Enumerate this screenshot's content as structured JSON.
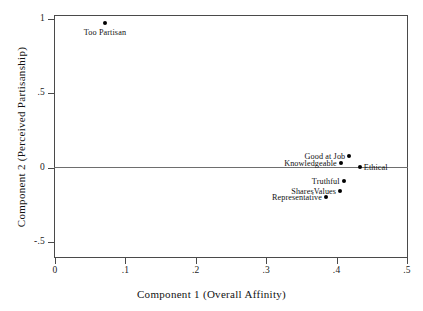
{
  "chart_data": {
    "type": "scatter",
    "title": "",
    "xlabel": "Component 1 (Overall Affinity)",
    "ylabel": "Component 2 (Perceived Partisanship)",
    "xlim": [
      0,
      0.5
    ],
    "ylim": [
      -0.5,
      1
    ],
    "xticks": [
      "0",
      ".1",
      ".2",
      ".3",
      ".4",
      ".5"
    ],
    "xtick_values": [
      0,
      0.1,
      0.2,
      0.3,
      0.4,
      0.5
    ],
    "yticks": [
      "1",
      ".5",
      "0",
      "-.5"
    ],
    "ytick_values": [
      1,
      0.5,
      0,
      -0.5
    ],
    "grid": false,
    "legend": "none",
    "zero_reference_line": 0,
    "points": [
      {
        "label": "Too Partisan",
        "x": 0.071,
        "y": 0.97,
        "label_pos": "below"
      },
      {
        "label": "Good at Job",
        "x": 0.418,
        "y": 0.08,
        "label_pos": "left"
      },
      {
        "label": "Knowledgeable",
        "x": 0.406,
        "y": 0.03,
        "label_pos": "left"
      },
      {
        "label": "Ethical",
        "x": 0.433,
        "y": 0.005,
        "label_pos": "right"
      },
      {
        "label": "Truthful",
        "x": 0.41,
        "y": -0.09,
        "label_pos": "left"
      },
      {
        "label": "SharesValues",
        "x": 0.405,
        "y": -0.155,
        "label_pos": "left"
      },
      {
        "label": "Representative",
        "x": 0.385,
        "y": -0.195,
        "label_pos": "left"
      }
    ]
  },
  "colors": {
    "marker": "#000000",
    "axis": "#4a4a4a",
    "zero_line": "#6e6e6e",
    "text": "#111111",
    "background": "#ffffff"
  }
}
